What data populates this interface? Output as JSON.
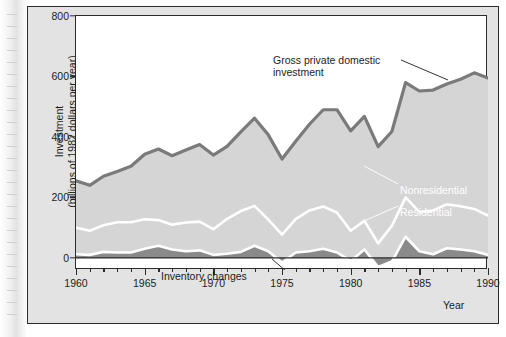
{
  "figure": {
    "axis_title_x": "Year",
    "axis_title_y": "Investment\n(billions of 1982 dollars per year)"
  },
  "annotations": {
    "gross_private": "Gross private domestic\ninvestment",
    "inventory": "Inventory changes",
    "nonresidential": "Nonresidential",
    "residential": "Residential"
  },
  "colors": {
    "area_fill": "#d5d5d5",
    "inventory_fill": "#8a8a8a",
    "top_line": "#7a7a7a",
    "separator_line": "#ffffff",
    "axis": "#2b2b2b",
    "card_background": "#e3e3e3",
    "plot_background": "#ffffff",
    "inner_label_text": "#ffffff"
  },
  "chart_data": {
    "type": "area",
    "title": "",
    "subtitle": "",
    "xlabel": "Year",
    "ylabel": "Investment (billions of 1982 dollars per year)",
    "xlim": [
      1960,
      1990
    ],
    "ylim": [
      -40,
      800
    ],
    "yticks": [
      0,
      200,
      400,
      600,
      800
    ],
    "xticks_major": [
      1960,
      1965,
      1970,
      1975,
      1980,
      1985,
      1990
    ],
    "xtick_minor_step": 1,
    "grid": false,
    "legend": "in-plot labels",
    "stacking": "Inventory changes + Residential + Nonresidential = Gross private domestic investment",
    "x": [
      1960,
      1961,
      1962,
      1963,
      1964,
      1965,
      1966,
      1967,
      1968,
      1969,
      1970,
      1971,
      1972,
      1973,
      1974,
      1975,
      1976,
      1977,
      1978,
      1979,
      1980,
      1981,
      1982,
      1983,
      1984,
      1985,
      1986,
      1987,
      1988,
      1989,
      1990
    ],
    "series": [
      {
        "name": "Inventory changes",
        "color": "#8a8a8a",
        "values": [
          12,
          10,
          20,
          18,
          18,
          30,
          40,
          28,
          22,
          25,
          10,
          14,
          20,
          40,
          22,
          -15,
          18,
          22,
          30,
          18,
          -10,
          28,
          -30,
          -12,
          70,
          22,
          12,
          32,
          28,
          22,
          10
        ]
      },
      {
        "name": "Residential",
        "color": "#d5d5d5",
        "values": [
          88,
          80,
          88,
          100,
          100,
          98,
          85,
          82,
          95,
          95,
          85,
          115,
          135,
          132,
          105,
          92,
          110,
          135,
          140,
          132,
          100,
          95,
          78,
          118,
          130,
          130,
          145,
          145,
          143,
          140,
          130
        ]
      },
      {
        "name": "Nonresidential",
        "color": "#d5d5d5",
        "values": [
          155,
          150,
          162,
          168,
          185,
          215,
          235,
          228,
          240,
          255,
          245,
          240,
          262,
          290,
          280,
          250,
          258,
          285,
          320,
          340,
          330,
          345,
          320,
          312,
          380,
          400,
          398,
          398,
          420,
          450,
          455
        ]
      },
      {
        "name": "Gross private domestic investment",
        "color": "#7a7a7a",
        "values": [
          255,
          240,
          270,
          286,
          303,
          343,
          360,
          338,
          357,
          375,
          340,
          369,
          417,
          462,
          407,
          327,
          386,
          442,
          490,
          490,
          420,
          468,
          368,
          418,
          580,
          552,
          555,
          575,
          591,
          612,
          595
        ]
      }
    ],
    "notes": [
      "Stacked area chart of U.S. real gross private domestic investment, 1960-1990.",
      "Inventory changes band sits around zero and goes negative in 1975, 1980 and 1982.",
      "Total peaks near 700 around 1989 and troughs near 330 in 1975 and 1982."
    ]
  }
}
